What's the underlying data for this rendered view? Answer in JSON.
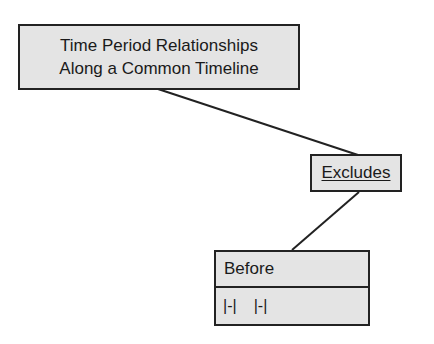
{
  "diagram": {
    "root": {
      "lines": [
        "Time Period Relationships",
        "Along a Common Timeline"
      ]
    },
    "relation": {
      "label": "Excludes"
    },
    "class": {
      "name": "Before",
      "notation": [
        "|-|",
        "|-|"
      ]
    },
    "connectors": [
      {
        "from": "root",
        "to": "relation",
        "x1": 158,
        "y1": 89,
        "x2": 358,
        "y2": 155
      },
      {
        "from": "relation",
        "to": "class",
        "x1": 359,
        "y1": 192,
        "x2": 292,
        "y2": 250
      }
    ],
    "colors": {
      "box_fill": "#e4e4e4",
      "stroke": "#222222",
      "background": "#ffffff"
    }
  }
}
